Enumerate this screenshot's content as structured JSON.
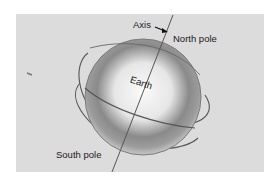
{
  "figure": {
    "labels": {
      "axis": "Axis",
      "north_pole": "North pole",
      "south_pole": "South pole",
      "earth": "Earth"
    },
    "colors": {
      "background": "#dcdcdc",
      "line": "#4a4a4a",
      "globe_core": "#f4f4f4",
      "globe_edge": "#6a6a6a"
    }
  }
}
